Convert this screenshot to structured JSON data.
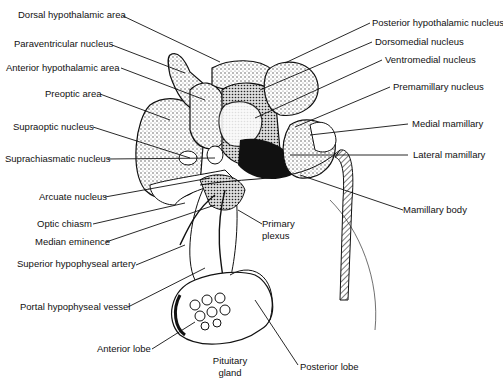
{
  "labels_left": [
    {
      "id": "dorsal-hypothalamic-area",
      "text": "Dorsal hypothalamic area"
    },
    {
      "id": "paraventricular-nucleus",
      "text": "Paraventricular nucleus"
    },
    {
      "id": "anterior-hypothalamic-area",
      "text": "Anterior hypothalamic area"
    },
    {
      "id": "preoptic-area",
      "text": "Preoptic area"
    },
    {
      "id": "supraoptic-nucleus",
      "text": "Supraoptic nucleus"
    },
    {
      "id": "suprachiasmatic-nucleus",
      "text": "Suprachiasmatic nucleus"
    },
    {
      "id": "arcuate-nucleus",
      "text": "Arcuate nucleus"
    },
    {
      "id": "optic-chiasm",
      "text": "Optic chiasm"
    },
    {
      "id": "median-eminence",
      "text": "Median eminence"
    },
    {
      "id": "superior-hypophyseal-artery",
      "text": "Superior hypophyseal artery"
    },
    {
      "id": "portal-hypophyseal-vessel",
      "text": "Portal hypophyseal vessel"
    },
    {
      "id": "anterior-lobe",
      "text": "Anterior lobe"
    }
  ],
  "labels_right": [
    {
      "id": "posterior-hypothalamic-nucleus",
      "text": "Posterior hypothalamic nucleus"
    },
    {
      "id": "dorsomedial-nucleus",
      "text": "Dorsomedial nucleus"
    },
    {
      "id": "ventromedial-nucleus",
      "text": "Ventromedial nucleus"
    },
    {
      "id": "premamillary-nucleus",
      "text": "Premamillary nucleus"
    },
    {
      "id": "medial-mamillary",
      "text": "Medial mamillary"
    },
    {
      "id": "lateral-mamillary",
      "text": "Lateral mamillary"
    },
    {
      "id": "mamillary-body",
      "text": "Mamillary body"
    }
  ],
  "labels_center": [
    {
      "id": "primary-plexus",
      "text": "Primary plexus"
    },
    {
      "id": "pituitary-gland",
      "text": "Pituitary gland"
    },
    {
      "id": "posterior-lobe",
      "text": "Posterior lobe"
    }
  ]
}
